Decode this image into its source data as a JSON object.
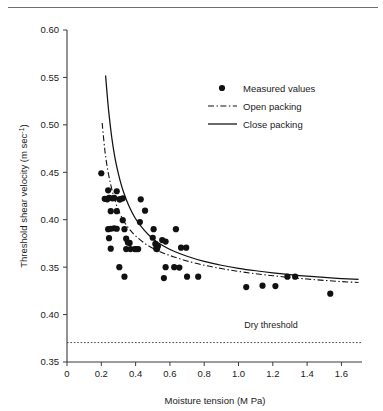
{
  "figure": {
    "background": "#ffffff",
    "ink": "#111111",
    "top_rule": true
  },
  "chart_data": {
    "type": "scatter",
    "title": "",
    "xlabel": "Moisture tension (M Pa)",
    "ylabel": "Threshold shear velocity (m sec",
    "ylabel_exponent": "-1",
    "ylabel_suffix": ")",
    "grid": false,
    "legend_position": "upper-right",
    "xlim": [
      0,
      1.72
    ],
    "ylim_index": [
      0,
      7
    ],
    "xticks": [
      "0",
      "0.2",
      "0.4",
      "0.6",
      "0.8",
      "1.0",
      "1.2",
      "1.4",
      "1.6"
    ],
    "xtick_values": [
      0,
      0.2,
      0.4,
      0.6,
      0.8,
      1.0,
      1.2,
      1.4,
      1.6
    ],
    "yticks": [
      "0.60",
      "0.55",
      "0.50",
      "0.45",
      "0.40",
      "0.35",
      "0.40",
      "0.35"
    ],
    "ytick_values": [
      0.6,
      0.55,
      0.5,
      0.45,
      0.4,
      0.35,
      0.3,
      0.25
    ],
    "series": [
      {
        "name": "Measured values",
        "type": "scatter",
        "marker": "filled-circle",
        "color": "#111111",
        "points": [
          [
            0.2,
            0.449
          ],
          [
            0.24,
            0.431
          ],
          [
            0.22,
            0.422
          ],
          [
            0.235,
            0.4215
          ],
          [
            0.245,
            0.423
          ],
          [
            0.265,
            0.4225
          ],
          [
            0.275,
            0.423
          ],
          [
            0.29,
            0.43
          ],
          [
            0.31,
            0.4215
          ],
          [
            0.325,
            0.4225
          ],
          [
            0.255,
            0.409
          ],
          [
            0.29,
            0.409
          ],
          [
            0.305,
            0.4215
          ],
          [
            0.325,
            0.3995
          ],
          [
            0.24,
            0.39
          ],
          [
            0.255,
            0.3905
          ],
          [
            0.275,
            0.391
          ],
          [
            0.29,
            0.3905
          ],
          [
            0.245,
            0.3805
          ],
          [
            0.335,
            0.39
          ],
          [
            0.345,
            0.38
          ],
          [
            0.355,
            0.376
          ],
          [
            0.365,
            0.3755
          ],
          [
            0.37,
            0.369
          ],
          [
            0.345,
            0.369
          ],
          [
            0.255,
            0.3695
          ],
          [
            0.395,
            0.369
          ],
          [
            0.405,
            0.369
          ],
          [
            0.415,
            0.369
          ],
          [
            0.43,
            0.4215
          ],
          [
            0.455,
            0.4095
          ],
          [
            0.425,
            0.3975
          ],
          [
            0.505,
            0.39
          ],
          [
            0.5,
            0.381
          ],
          [
            0.515,
            0.3745
          ],
          [
            0.52,
            0.3695
          ],
          [
            0.525,
            0.369
          ],
          [
            0.53,
            0.372
          ],
          [
            0.555,
            0.3785
          ],
          [
            0.575,
            0.377
          ],
          [
            0.635,
            0.39
          ],
          [
            0.665,
            0.3705
          ],
          [
            0.695,
            0.3705
          ],
          [
            0.575,
            0.35
          ],
          [
            0.625,
            0.35
          ],
          [
            0.655,
            0.3495
          ],
          [
            0.305,
            0.35
          ],
          [
            0.335,
            0.34
          ],
          [
            0.565,
            0.3385
          ],
          [
            0.7,
            0.34
          ],
          [
            0.765,
            0.34
          ],
          [
            1.045,
            0.329
          ],
          [
            1.14,
            0.3305
          ],
          [
            1.215,
            0.33
          ],
          [
            1.285,
            0.34
          ],
          [
            1.33,
            0.34
          ],
          [
            1.535,
            0.322
          ]
        ]
      },
      {
        "name": "Open packing",
        "type": "line",
        "style": "dash-dot",
        "color": "#111111",
        "points": [
          [
            0.205,
            0.502
          ],
          [
            0.215,
            0.483
          ],
          [
            0.225,
            0.467
          ],
          [
            0.24,
            0.45
          ],
          [
            0.26,
            0.433
          ],
          [
            0.28,
            0.42
          ],
          [
            0.3,
            0.41
          ],
          [
            0.33,
            0.399
          ],
          [
            0.36,
            0.391
          ],
          [
            0.4,
            0.383
          ],
          [
            0.45,
            0.3755
          ],
          [
            0.5,
            0.37
          ],
          [
            0.56,
            0.365
          ],
          [
            0.62,
            0.361
          ],
          [
            0.7,
            0.3565
          ],
          [
            0.8,
            0.352
          ],
          [
            0.9,
            0.3485
          ],
          [
            1.0,
            0.3455
          ],
          [
            1.1,
            0.343
          ],
          [
            1.2,
            0.341
          ],
          [
            1.3,
            0.339
          ],
          [
            1.4,
            0.3375
          ],
          [
            1.5,
            0.336
          ],
          [
            1.6,
            0.3348
          ],
          [
            1.7,
            0.3338
          ]
        ]
      },
      {
        "name": "Close packing",
        "type": "line",
        "style": "solid",
        "color": "#111111",
        "points": [
          [
            0.225,
            0.552
          ],
          [
            0.235,
            0.53
          ],
          [
            0.245,
            0.511
          ],
          [
            0.26,
            0.488
          ],
          [
            0.275,
            0.47
          ],
          [
            0.29,
            0.456
          ],
          [
            0.31,
            0.441
          ],
          [
            0.33,
            0.429
          ],
          [
            0.36,
            0.415
          ],
          [
            0.4,
            0.401
          ],
          [
            0.45,
            0.389
          ],
          [
            0.5,
            0.38
          ],
          [
            0.56,
            0.3725
          ],
          [
            0.62,
            0.367
          ],
          [
            0.7,
            0.3615
          ],
          [
            0.8,
            0.356
          ],
          [
            0.9,
            0.352
          ],
          [
            1.0,
            0.3488
          ],
          [
            1.1,
            0.3462
          ],
          [
            1.2,
            0.344
          ],
          [
            1.3,
            0.3421
          ],
          [
            1.4,
            0.3405
          ],
          [
            1.5,
            0.3392
          ],
          [
            1.6,
            0.338
          ],
          [
            1.7,
            0.337
          ]
        ]
      }
    ],
    "annotations": [
      {
        "name": "dry-threshold",
        "label": "Dry threshold",
        "type": "hline",
        "y": 0.2705,
        "style": "dotted",
        "label_x": 1.19,
        "label_y": 0.286
      }
    ]
  },
  "legend": {
    "items": [
      {
        "label": "Measured values",
        "marker": "filled-circle"
      },
      {
        "label": "Open packing",
        "marker": "dash-dot-line"
      },
      {
        "label": "Close packing",
        "marker": "solid-line"
      }
    ]
  }
}
